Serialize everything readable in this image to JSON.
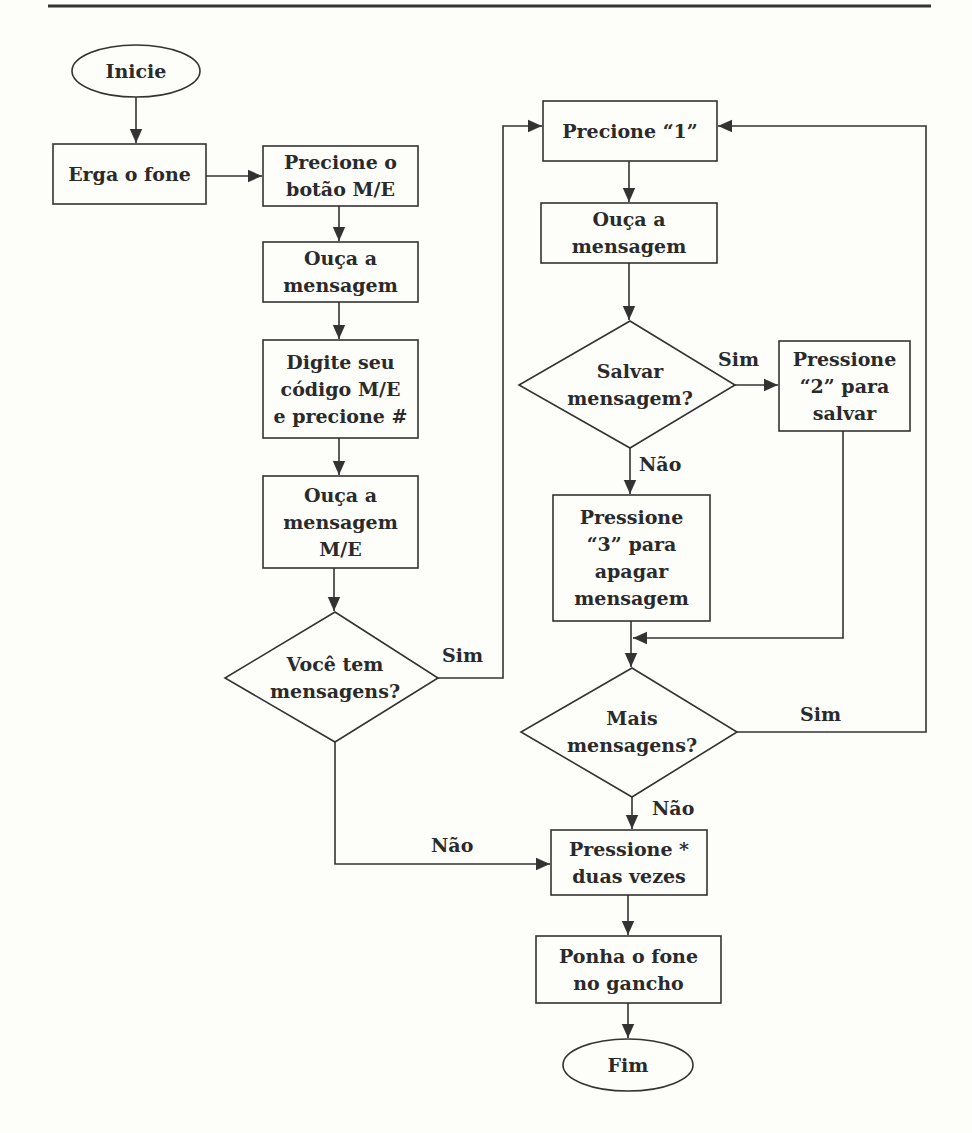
{
  "nodes": {
    "start": "Inicie",
    "lift": "Erga o fone",
    "press_me": "Precione o\nbotão M/E",
    "listen1": "Ouça a\nmensagem",
    "code": "Digite seu\ncódigo M/E\ne precione #",
    "listen_me": "Ouça a\nmensagem\nM/E",
    "have_msgs": "Você tem\nmensagens?",
    "press1": "Precione “1”",
    "listen2": "Ouça a\nmensagem",
    "save_q": "Salvar\nmensagem?",
    "press2": "Pressione\n“2” para\nsalvar",
    "press3": "Pressione\n“3” para\napagar\nmensagem",
    "more_q": "Mais\nmensagens?",
    "press_star": "Pressione *\nduas vezes",
    "hangup": "Ponha o fone\nno gancho",
    "end": "Fim"
  },
  "edges": {
    "have_yes": "Sim",
    "have_no": "Não",
    "save_yes": "Sim",
    "save_no": "Não",
    "more_yes": "Sim",
    "more_no": "Não"
  },
  "colors": {
    "line": "#333333",
    "background": "#fdfdfa"
  }
}
